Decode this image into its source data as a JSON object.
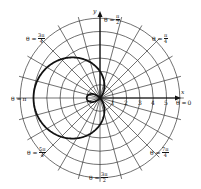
{
  "chart_data": {
    "type": "line",
    "subtype": "polar",
    "title": "",
    "curve": {
      "name": "limacon with inner loop",
      "equation_estimate": "r = 2 - 3cos(θ)",
      "color": "#111111",
      "points_r_theta": [
        [
          -1.0,
          "0"
        ],
        [
          2.0,
          "π/2"
        ],
        [
          5.0,
          "π"
        ],
        [
          2.0,
          "3π/2"
        ]
      ]
    },
    "radial_ticks": [
      "1",
      "2",
      "3",
      "4",
      "5"
    ],
    "rmax": 6,
    "angle_lines_deg_step": 15,
    "angle_labels": [
      {
        "prefix": "θ =",
        "num": "π",
        "den": "2",
        "angle": "90"
      },
      {
        "prefix": "θ =",
        "num": "π",
        "den": "4",
        "angle": "45"
      },
      {
        "prefix": "θ =",
        "num": "3π",
        "den": "4",
        "angle": "135"
      },
      {
        "prefix": "θ =",
        "text": "π",
        "angle": "180"
      },
      {
        "prefix": "θ =",
        "text": "0",
        "angle": "0"
      },
      {
        "prefix": "θ =",
        "num": "5π",
        "den": "4",
        "angle": "225"
      },
      {
        "prefix": "θ =",
        "num": "3π",
        "den": "2",
        "angle": "270"
      },
      {
        "prefix": "θ =",
        "num": "7π",
        "den": "4",
        "angle": "315"
      }
    ],
    "axis_labels": {
      "x": "x",
      "y": "y"
    },
    "grid": true,
    "legend": null
  }
}
